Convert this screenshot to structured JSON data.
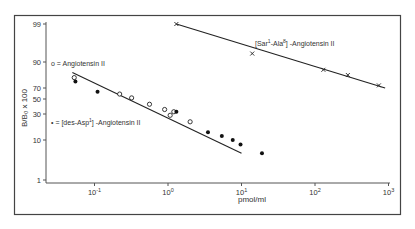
{
  "chart_data": {
    "type": "scatter",
    "title": "",
    "xlabel": "pmol/ml",
    "ylabel": "B/B₀ x 100",
    "x_scale": "log",
    "y_scale": "probability",
    "xlim": [
      0.035,
      1000
    ],
    "ylim": [
      1,
      99
    ],
    "x_ticks": [
      {
        "value": 0.1,
        "label_base": "10",
        "label_exp": "-1"
      },
      {
        "value": 1,
        "label_base": "10",
        "label_exp": "0"
      },
      {
        "value": 10,
        "label_base": "10",
        "label_exp": "1"
      },
      {
        "value": 100,
        "label_base": "10",
        "label_exp": "2"
      },
      {
        "value": 1000,
        "label_base": "10",
        "label_exp": "3"
      }
    ],
    "y_ticks": [
      99,
      90,
      70,
      50,
      30,
      10,
      1
    ],
    "y_tick_labels": [
      "99",
      "90",
      "70",
      "50",
      "30",
      "10",
      "1"
    ],
    "grid": false,
    "series": [
      {
        "name": "Angiotensin II",
        "marker": "open-circle",
        "legend_label": "o = Angiotensin II",
        "points": [
          [
            0.053,
            78
          ],
          [
            0.22,
            59
          ],
          [
            0.32,
            52
          ],
          [
            0.56,
            43
          ],
          [
            0.9,
            36
          ],
          [
            1.2,
            33
          ],
          [
            1.07,
            29
          ],
          [
            2.0,
            24
          ]
        ]
      },
      {
        "name": "[des-Asp1]-Angiotensin II",
        "marker": "filled-circle",
        "legend_label_prefix": "• = [des-Asp",
        "legend_label_sup": "1",
        "legend_label_suffix": "] -Angiotensin II",
        "points": [
          [
            0.055,
            75
          ],
          [
            0.11,
            63
          ],
          [
            1.3,
            33
          ],
          [
            3.5,
            16
          ],
          [
            5.4,
            13
          ],
          [
            7.6,
            10
          ],
          [
            9.7,
            9
          ],
          [
            19,
            7
          ]
        ]
      },
      {
        "name": "[Sar1-Ala8]-Angiotensin II",
        "marker": "x",
        "legend_label_prefix": "[Sar",
        "legend_label_sup1": "1",
        "legend_label_mid": "-Ala",
        "legend_label_sup2": "8",
        "legend_label_suffix": "] -Angiotensin II",
        "points": [
          [
            1.3,
            99
          ],
          [
            14,
            92
          ],
          [
            130,
            84
          ],
          [
            280,
            80
          ],
          [
            740,
            72
          ]
        ]
      }
    ],
    "fit_lines": [
      {
        "name": "Angiotensin II fit",
        "from": [
          0.05,
          82
        ],
        "to": [
          10,
          7
        ]
      },
      {
        "name": "[Sar1-Ala8]-Angiotensin II fit",
        "from": [
          1.3,
          99
        ],
        "to": [
          900,
          70
        ]
      }
    ]
  }
}
